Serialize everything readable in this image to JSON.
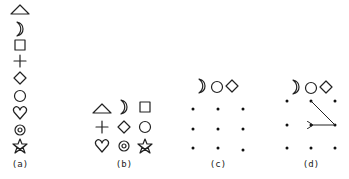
{
  "figure": {
    "panels": [
      {
        "id": "a",
        "label": "(a)",
        "layout": "vertical-column",
        "symbols": [
          "triangle",
          "crescent-moon",
          "square",
          "plus",
          "diamond",
          "circle",
          "heart",
          "bullseye",
          "star"
        ]
      },
      {
        "id": "b",
        "label": "(b)",
        "layout": "3x3-grid",
        "symbols": [
          [
            "triangle",
            "crescent-moon",
            "square"
          ],
          [
            "plus",
            "diamond",
            "circle"
          ],
          [
            "heart",
            "bullseye",
            "star"
          ]
        ]
      },
      {
        "id": "c",
        "label": "(c)",
        "layout": "3x3-dot-grid",
        "sequence": [
          "crescent-moon",
          "circle",
          "diamond"
        ],
        "dots": 9
      },
      {
        "id": "d",
        "label": "(d)",
        "layout": "3x3-dot-grid-with-path",
        "sequence": [
          "crescent-moon",
          "circle",
          "diamond"
        ],
        "dots": 9,
        "path": [
          "top-middle",
          "middle-right",
          "center"
        ]
      }
    ],
    "colors": {
      "ink": "#222222",
      "background": "#ffffff"
    }
  }
}
